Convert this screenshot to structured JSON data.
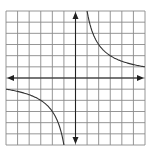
{
  "chart_data": {
    "type": "line",
    "title": "",
    "xlabel": "",
    "ylabel": "",
    "xlim": [
      -6,
      6
    ],
    "ylim": [
      -6,
      6
    ],
    "grid": true,
    "grid_step": 1,
    "axes_arrows": true,
    "series": [
      {
        "name": "branch-quadrant-1",
        "function": "y = 6/x",
        "x": [
          1,
          1.2,
          1.5,
          2,
          2.5,
          3,
          4,
          5,
          6
        ],
        "y": [
          6,
          5,
          4,
          3,
          2.4,
          2,
          1.5,
          1.2,
          1
        ]
      },
      {
        "name": "branch-quadrant-3",
        "function": "y = 6/x",
        "x": [
          -1,
          -1.2,
          -1.5,
          -2,
          -2.5,
          -3,
          -4,
          -5,
          -6
        ],
        "y": [
          -6,
          -5,
          -4,
          -3,
          -2.4,
          -2,
          -1.5,
          -1.2,
          -1
        ]
      }
    ]
  },
  "colors": {
    "grid": "#8a8a8a",
    "axis": "#222222",
    "curve": "#333333"
  }
}
